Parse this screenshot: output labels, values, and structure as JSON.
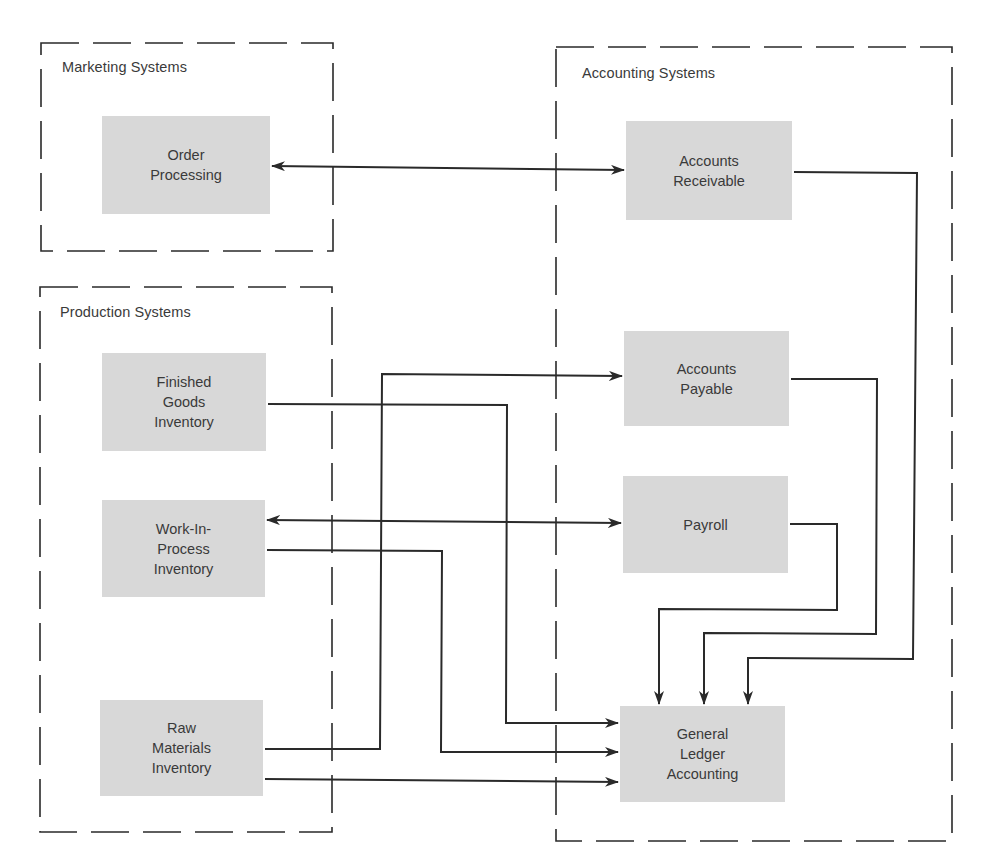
{
  "diagram": {
    "colors": {
      "node_fill": "#d8d8d8",
      "line": "#2a2a2a",
      "background": "#ffffff"
    },
    "groups": [
      {
        "id": "marketing",
        "label": "Marketing Systems"
      },
      {
        "id": "accounting",
        "label": "Accounting Systems"
      },
      {
        "id": "production",
        "label": "Production Systems"
      }
    ],
    "nodes": {
      "order_processing": {
        "group": "marketing",
        "lines": [
          "Order",
          "Processing"
        ]
      },
      "accounts_receivable": {
        "group": "accounting",
        "lines": [
          "Accounts",
          "Receivable"
        ]
      },
      "accounts_payable": {
        "group": "accounting",
        "lines": [
          "Accounts",
          "Payable"
        ]
      },
      "payroll": {
        "group": "accounting",
        "lines": [
          "Payroll"
        ]
      },
      "general_ledger": {
        "group": "accounting",
        "lines": [
          "General",
          "Ledger",
          "Accounting"
        ]
      },
      "finished_goods": {
        "group": "production",
        "lines": [
          "Finished",
          "Goods",
          "Inventory"
        ]
      },
      "work_in_process": {
        "group": "production",
        "lines": [
          "Work-In-",
          "Process",
          "Inventory"
        ]
      },
      "raw_materials": {
        "group": "production",
        "lines": [
          "Raw",
          "Materials",
          "Inventory"
        ]
      }
    },
    "edges": [
      {
        "from": "order_processing",
        "to": "accounts_receivable",
        "direction": "both"
      },
      {
        "from": "work_in_process",
        "to": "payroll",
        "direction": "both"
      },
      {
        "from": "raw_materials",
        "to": "accounts_payable",
        "direction": "forward"
      },
      {
        "from": "finished_goods",
        "to": "general_ledger",
        "direction": "forward"
      },
      {
        "from": "work_in_process",
        "to": "general_ledger",
        "direction": "forward"
      },
      {
        "from": "raw_materials",
        "to": "general_ledger",
        "direction": "forward"
      },
      {
        "from": "payroll",
        "to": "general_ledger",
        "direction": "forward"
      },
      {
        "from": "accounts_payable",
        "to": "general_ledger",
        "direction": "forward"
      },
      {
        "from": "accounts_receivable",
        "to": "general_ledger",
        "direction": "forward"
      }
    ]
  }
}
